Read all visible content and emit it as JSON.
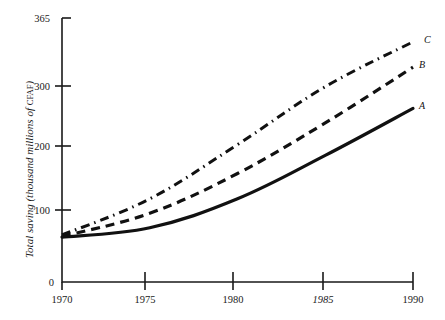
{
  "chart_data": {
    "type": "line",
    "title": "",
    "subtitle": "",
    "xlabel": "",
    "ylabel": "Total saving (thousand millions of CFAF)",
    "ylabel_main": "Total saving (thousand millions of ",
    "ylabel_unit": "CFAF",
    "ylabel_close": ")",
    "x": [
      1970,
      1975,
      1980,
      1985,
      1990
    ],
    "xtick_labels": [
      "1970",
      "1975",
      "1980",
      "1985",
      "1990"
    ],
    "xtick_italic": [
      false,
      false,
      false,
      true,
      false
    ],
    "ytick_labels": [
      "0",
      "100",
      "200",
      "300",
      "365"
    ],
    "ytick_values": [
      0,
      100,
      200,
      300,
      365
    ],
    "xlim": [
      1970,
      1990
    ],
    "ylim": [
      0,
      365
    ],
    "grid": false,
    "legend_position": "right-inline-end-of-line",
    "series": [
      {
        "name": "A",
        "label": "A",
        "style": "solid",
        "color": "#111111",
        "values": [
          62,
          75,
          115,
          175,
          240
        ]
      },
      {
        "name": "B",
        "label": "B",
        "style": "dashed",
        "color": "#111111",
        "values": [
          63,
          95,
          150,
          220,
          297
        ]
      },
      {
        "name": "C",
        "label": "C",
        "style": "dashdot",
        "color": "#111111",
        "values": [
          65,
          115,
          190,
          270,
          332
        ]
      }
    ],
    "annotations": []
  }
}
